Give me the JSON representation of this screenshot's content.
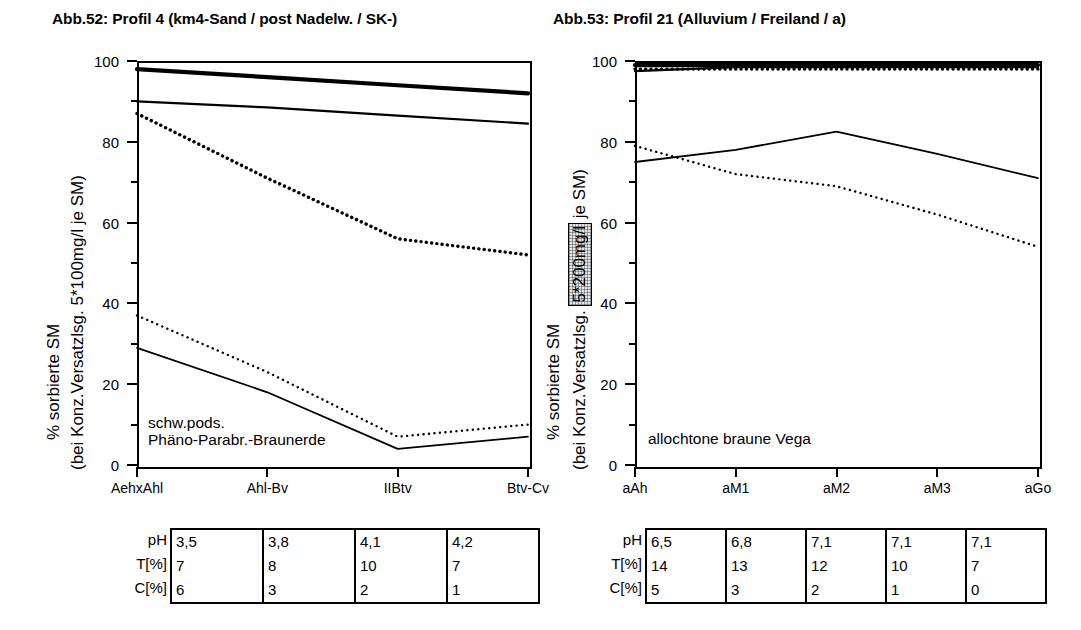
{
  "charts": [
    {
      "id": "abb52",
      "title": "Abb.52: Profil 4 (km4-Sand / post Nadelw. / SK-)",
      "annotation_line1": "schw.pods.",
      "annotation_line2": "Phäno-Parabr.-Braunerde",
      "ylabel_main": "% sorbierte SM",
      "ylabel_sub_pre": "(bei Konz.Versatzlsg. ",
      "ylabel_sub_hl": "5*100mg/l",
      "ylabel_sub_post": " je SM)",
      "highlighted": false,
      "table": {
        "row_labels": [
          "pH",
          "T[%]",
          "C[%]"
        ],
        "rows": [
          [
            "3,5",
            "3,8",
            "4,1",
            "4,2"
          ],
          [
            "7",
            "8",
            "10",
            "7"
          ],
          [
            "6",
            "3",
            "2",
            "1"
          ]
        ]
      },
      "chart_data": {
        "type": "line",
        "title": "Abb.52: Profil 4 (km4-Sand / post Nadelw. / SK-)",
        "xlabel": "",
        "ylabel": "% sorbierte SM (bei Konz.Versatzlsg. 5*100mg/l je SM)",
        "categories": [
          "AehxAhl",
          "Ahl-Bv",
          "IIBtv",
          "Btv-Cv"
        ],
        "ylim": [
          0,
          100
        ],
        "yticks": [
          0,
          20,
          40,
          60,
          80,
          100
        ],
        "grid": false,
        "legend": "none",
        "series": [
          {
            "name": "series-1-thick-solid",
            "style": "solid-thick",
            "values": [
              98,
              96,
              94,
              92
            ]
          },
          {
            "name": "series-2-medium-solid",
            "style": "solid-medium",
            "values": [
              90,
              88.5,
              86.5,
              84.5
            ]
          },
          {
            "name": "series-3-bold-dotted",
            "style": "dotted-bold",
            "values": [
              87,
              71,
              56,
              52
            ]
          },
          {
            "name": "series-4-fine-dotted",
            "style": "dotted-fine",
            "values": [
              37,
              23,
              7,
              10
            ]
          },
          {
            "name": "series-5-thin-solid",
            "style": "solid-thin",
            "values": [
              29,
              18,
              4,
              7
            ]
          }
        ]
      }
    },
    {
      "id": "abb53",
      "title": "Abb.53: Profil 21 (Alluvium / Freiland / a)",
      "annotation_line1": "allochtone braune Vega",
      "annotation_line2": "",
      "ylabel_main": "% sorbierte SM",
      "ylabel_sub_pre": "(bei Konz.Versatzlsg. ",
      "ylabel_sub_hl": "5*200mg/l",
      "ylabel_sub_post": " je SM)",
      "highlighted": true,
      "table": {
        "row_labels": [
          "pH",
          "T[%]",
          "C[%]"
        ],
        "rows": [
          [
            "6,5",
            "6,8",
            "7,1",
            "7,1",
            "7,1"
          ],
          [
            "14",
            "13",
            "12",
            "10",
            "7"
          ],
          [
            "5",
            "3",
            "2",
            "1",
            "0"
          ]
        ]
      },
      "chart_data": {
        "type": "line",
        "title": "Abb.53: Profil 21 (Alluvium / Freiland / a)",
        "xlabel": "",
        "ylabel": "% sorbierte SM (bei Konz.Versatzlsg. 5*200mg/l je SM)",
        "categories": [
          "aAh",
          "aM1",
          "aM2",
          "aM3",
          "aGo"
        ],
        "ylim": [
          0,
          100
        ],
        "yticks": [
          0,
          20,
          40,
          60,
          80,
          100
        ],
        "grid": false,
        "legend": "none",
        "series": [
          {
            "name": "series-1-thick-solid",
            "style": "solid-thick",
            "values": [
              99,
              99,
              99,
              99,
              99
            ]
          },
          {
            "name": "series-2-medium-solid",
            "style": "solid-medium",
            "values": [
              97.5,
              98.5,
              98.5,
              98.5,
              98.5
            ]
          },
          {
            "name": "series-3-bold-dotted",
            "style": "dotted-bold",
            "values": [
              98,
              98,
              98,
              98,
              98
            ]
          },
          {
            "name": "series-4-fine-dotted",
            "style": "dotted-fine",
            "values": [
              79,
              72,
              69,
              62,
              54
            ]
          },
          {
            "name": "series-5-thin-solid",
            "style": "solid-thin",
            "values": [
              75,
              78,
              82.5,
              77,
              71
            ]
          }
        ]
      }
    }
  ]
}
